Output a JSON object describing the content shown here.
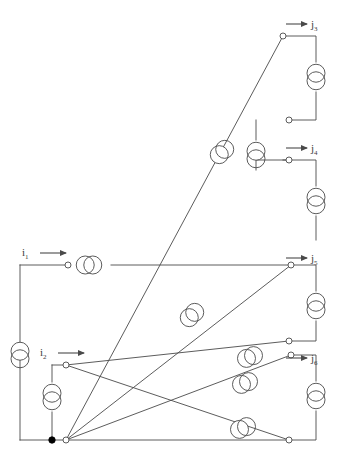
{
  "figure": {
    "type": "circuit-diagram",
    "title": "",
    "background_color": "#ffffff",
    "stroke_color": "#4a4a4a",
    "node_fill": "#ffffff",
    "dot_fill": "#000000",
    "stroke_width": 0.9
  },
  "labels": {
    "inputs": [
      {
        "id": "i1",
        "base": "i",
        "subscript": "1",
        "x": 22,
        "y": 256,
        "arrow_x1": 40,
        "arrow_x2": 66,
        "arrow_y": 253
      },
      {
        "id": "i2",
        "base": "i",
        "subscript": "2",
        "x": 40,
        "y": 356,
        "arrow_x1": 58,
        "arrow_x2": 84,
        "arrow_y": 353
      }
    ],
    "outputs": [
      {
        "id": "j3",
        "base": "j",
        "subscript": "3",
        "x": 311,
        "y": 28,
        "arrow_x1": 286,
        "arrow_x2": 307,
        "arrow_y": 24
      },
      {
        "id": "j4",
        "base": "j",
        "subscript": "4",
        "x": 311,
        "y": 152,
        "arrow_x1": 286,
        "arrow_x2": 307,
        "arrow_y": 148
      },
      {
        "id": "j5",
        "base": "j",
        "subscript": "5",
        "x": 311,
        "y": 262,
        "arrow_x1": 286,
        "arrow_x2": 307,
        "arrow_y": 258
      },
      {
        "id": "j6",
        "base": "j",
        "subscript": "6",
        "x": 311,
        "y": 362,
        "arrow_x1": 286,
        "arrow_x2": 307,
        "arrow_y": 358
      }
    ]
  },
  "wires": [
    {
      "name": "left-rail-top",
      "d": "M 20 265 L 20 440"
    },
    {
      "name": "i1-horizontal",
      "d": "M 20 265 L 68 265"
    },
    {
      "name": "i1-to-right-rail",
      "d": "M 111 265 L 291 265"
    },
    {
      "name": "j3-top-lead",
      "d": "M 283 36 L 316 36 L 316 62"
    },
    {
      "name": "j3-lower-lead",
      "d": "M 316 92 L 316 120 L 289 120"
    },
    {
      "name": "j3-step-down",
      "d": "M 256 120 L 256 140"
    },
    {
      "name": "j4-step",
      "d": "M 256 170 L 256 160 L 289 160"
    },
    {
      "name": "j4-top-lead",
      "d": "M 283 160 L 316 160 L 316 186"
    },
    {
      "name": "j4-lower-lead",
      "d": "M 316 216 L 316 240"
    },
    {
      "name": "j5-top-lead",
      "d": "M 291 265 L 316 265 L 316 291"
    },
    {
      "name": "j5-lower-lead",
      "d": "M 316 321 L 316 341 L 289 341"
    },
    {
      "name": "j6-top-lead",
      "d": "M 291 355 L 316 355 L 316 381"
    },
    {
      "name": "j6-lower-lead",
      "d": "M 316 411 L 316 440 L 289 440"
    },
    {
      "name": "i2-branch-top",
      "d": "M 52 365 L 66 365"
    },
    {
      "name": "i2-vertical",
      "d": "M 52 365 L 52 382"
    },
    {
      "name": "i2-vertical-lower",
      "d": "M 52 412 L 52 440"
    },
    {
      "name": "bottom-rail",
      "d": "M 20 440 L 66 440"
    }
  ],
  "diagonals": [
    {
      "name": "hub-to-j3",
      "d": "M 66 440 L 283 36"
    },
    {
      "name": "hub-to-j5",
      "d": "M 66 440 L 291 265"
    },
    {
      "name": "hub-to-j6",
      "d": "M 66 440 L 291 355"
    },
    {
      "name": "hub-to-bottom",
      "d": "M 66 440 L 289 440"
    },
    {
      "name": "i2-node-to-lower-right",
      "d": "M 66 365 L 289 341"
    },
    {
      "name": "i2-node-to-bottom-right",
      "d": "M 66 365 L 289 440"
    }
  ],
  "coupled_pairs": [
    {
      "name": "i1-coil",
      "cx": 89,
      "cy": 265,
      "orientation": "horizontal",
      "r": 9
    },
    {
      "name": "left-rail-coil",
      "cx": 20,
      "cy": 355,
      "orientation": "vertical",
      "r": 9
    },
    {
      "name": "i2-coil",
      "cx": 52,
      "cy": 397,
      "orientation": "vertical",
      "r": 9
    },
    {
      "name": "j3-coil",
      "cx": 316,
      "cy": 77,
      "orientation": "vertical",
      "r": 9
    },
    {
      "name": "j3-step-coil",
      "cx": 256,
      "cy": 155,
      "orientation": "vertical",
      "r": 9
    },
    {
      "name": "j4-coil",
      "cx": 316,
      "cy": 201,
      "orientation": "vertical",
      "r": 9
    },
    {
      "name": "j5-coil",
      "cx": 316,
      "cy": 306,
      "orientation": "vertical",
      "r": 9
    },
    {
      "name": "j6-coil",
      "cx": 316,
      "cy": 396,
      "orientation": "vertical",
      "r": 9
    },
    {
      "name": "diag-j3-coil",
      "cx": 222,
      "cy": 152,
      "orientation": "diagonal-steep",
      "r": 9
    },
    {
      "name": "diag-j5-coil",
      "cx": 192,
      "cy": 315,
      "orientation": "diagonal-steep",
      "r": 9
    },
    {
      "name": "diag-j6-coil",
      "cx": 250,
      "cy": 357,
      "orientation": "diagonal-shallow",
      "r": 9
    },
    {
      "name": "diag-lower-coil",
      "cx": 245,
      "cy": 383,
      "orientation": "diagonal-shallow",
      "r": 9
    },
    {
      "name": "diag-bottom-coil",
      "cx": 243,
      "cy": 428,
      "orientation": "diagonal-shallow",
      "r": 9
    }
  ],
  "open_nodes": [
    {
      "name": "node-i1",
      "cx": 68,
      "cy": 265
    },
    {
      "name": "node-j3",
      "cx": 283,
      "cy": 36
    },
    {
      "name": "node-j3-return",
      "cx": 289,
      "cy": 120
    },
    {
      "name": "node-j4",
      "cx": 289,
      "cy": 160
    },
    {
      "name": "node-j5",
      "cx": 291,
      "cy": 265
    },
    {
      "name": "node-j5-return",
      "cx": 289,
      "cy": 341
    },
    {
      "name": "node-j6",
      "cx": 291,
      "cy": 355
    },
    {
      "name": "node-j6-return",
      "cx": 289,
      "cy": 440
    },
    {
      "name": "node-i2",
      "cx": 66,
      "cy": 365
    },
    {
      "name": "node-hub",
      "cx": 66,
      "cy": 440
    }
  ],
  "filled_nodes": [
    {
      "name": "node-common-ground",
      "cx": 52,
      "cy": 440,
      "r": 3.2
    }
  ]
}
